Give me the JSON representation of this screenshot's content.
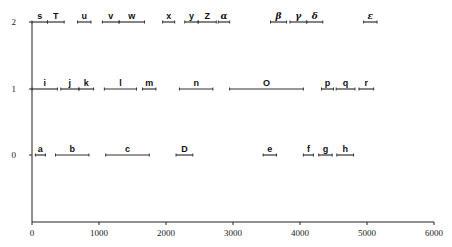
{
  "chart_data": {
    "type": "interval-timeline",
    "title": "",
    "xlabel": "",
    "ylabel": "",
    "xlim": [
      0,
      6000
    ],
    "ylim": [
      -1,
      2
    ],
    "x_ticks": [
      0,
      1000,
      2000,
      3000,
      4000,
      5000,
      6000
    ],
    "y_ticks": [
      0,
      1,
      2
    ],
    "grid": false,
    "legend": null,
    "series": [
      {
        "label": "a",
        "level": 0,
        "start": 50,
        "end": 200
      },
      {
        "label": "b",
        "level": 0,
        "start": 350,
        "end": 850
      },
      {
        "label": "c",
        "level": 0,
        "start": 1100,
        "end": 1750
      },
      {
        "label": "D",
        "level": 0,
        "start": 2150,
        "end": 2400
      },
      {
        "label": "e",
        "level": 0,
        "start": 3450,
        "end": 3650
      },
      {
        "label": "f",
        "level": 0,
        "start": 4050,
        "end": 4200
      },
      {
        "label": "g",
        "level": 0,
        "start": 4280,
        "end": 4480
      },
      {
        "label": "h",
        "level": 0,
        "start": 4550,
        "end": 4800
      },
      {
        "label": "i",
        "level": 1,
        "start": 0,
        "end": 380
      },
      {
        "label": "j",
        "level": 1,
        "start": 430,
        "end": 700
      },
      {
        "label": "k",
        "level": 1,
        "start": 700,
        "end": 920
      },
      {
        "label": "l",
        "level": 1,
        "start": 1080,
        "end": 1560
      },
      {
        "label": "m",
        "level": 1,
        "start": 1650,
        "end": 1850
      },
      {
        "label": "n",
        "level": 1,
        "start": 2200,
        "end": 2700
      },
      {
        "label": "O",
        "level": 1,
        "start": 2950,
        "end": 4050
      },
      {
        "label": "p",
        "level": 1,
        "start": 4320,
        "end": 4500
      },
      {
        "label": "q",
        "level": 1,
        "start": 4540,
        "end": 4820
      },
      {
        "label": "r",
        "level": 1,
        "start": 4880,
        "end": 5100
      },
      {
        "label": "s",
        "level": 2,
        "start": 0,
        "end": 230
      },
      {
        "label": "T",
        "level": 2,
        "start": 230,
        "end": 480
      },
      {
        "label": "u",
        "level": 2,
        "start": 680,
        "end": 880
      },
      {
        "label": "v",
        "level": 2,
        "start": 1050,
        "end": 1300
      },
      {
        "label": "w",
        "level": 2,
        "start": 1300,
        "end": 1680
      },
      {
        "label": "x",
        "level": 2,
        "start": 1950,
        "end": 2130
      },
      {
        "label": "y",
        "level": 2,
        "start": 2280,
        "end": 2480
      },
      {
        "label": "Z",
        "level": 2,
        "start": 2480,
        "end": 2750
      },
      {
        "label": "α",
        "level": 2,
        "start": 2780,
        "end": 2950
      },
      {
        "label": "β",
        "level": 2,
        "start": 3560,
        "end": 3800
      },
      {
        "label": "γ",
        "level": 2,
        "start": 3850,
        "end": 4100
      },
      {
        "label": "δ",
        "level": 2,
        "start": 4100,
        "end": 4340
      },
      {
        "label": "ε",
        "level": 2,
        "start": 4950,
        "end": 5150
      }
    ]
  }
}
